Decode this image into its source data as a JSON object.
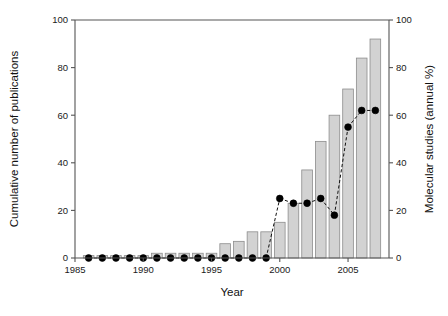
{
  "chart_data": {
    "type": "bar",
    "title": "",
    "subtitle": "",
    "xlabel": "Year",
    "ylabel": "Cumulative number of publications",
    "y2label": "Molecular studies (annual %)",
    "xlim": [
      1985,
      2008
    ],
    "ylim": [
      0,
      100
    ],
    "y2lim": [
      0,
      100
    ],
    "grid": false,
    "legend": "none",
    "x_ticks": [
      1985,
      1990,
      1995,
      2000,
      2005
    ],
    "x_tick_labels": [
      "1985",
      "1990",
      "1995",
      "2000",
      "2005"
    ],
    "y_ticks": [
      0,
      20,
      40,
      60,
      80,
      100
    ],
    "y_tick_labels": [
      "0",
      "20",
      "40",
      "60",
      "80",
      "100"
    ],
    "y2_ticks": [
      0,
      20,
      40,
      60,
      80,
      100
    ],
    "y2_tick_labels": [
      "0",
      "20",
      "40",
      "60",
      "80",
      "100"
    ],
    "categories": [
      1986,
      1987,
      1988,
      1989,
      1990,
      1991,
      1992,
      1993,
      1994,
      1995,
      1996,
      1997,
      1998,
      1999,
      2000,
      2001,
      2002,
      2003,
      2004,
      2005,
      2006,
      2007
    ],
    "series": [
      {
        "name": "Cumulative number of publications",
        "type": "bar",
        "axis": "left",
        "color": "#d2d2d2",
        "edge_color": "#8d8d8d",
        "values": [
          1,
          1,
          1,
          1,
          1,
          2,
          2,
          2,
          2,
          2,
          6,
          7,
          11,
          11,
          15,
          23,
          37,
          49,
          60,
          71,
          84,
          92
        ]
      },
      {
        "name": "Molecular studies (annual %)",
        "type": "line",
        "axis": "right",
        "color": "#000000",
        "marker": "filled-circle",
        "linestyle": "dashed",
        "values": [
          0,
          0,
          0,
          0,
          0,
          0,
          0,
          0,
          0,
          0,
          0,
          0,
          0,
          0,
          25,
          23,
          23,
          25,
          18,
          55,
          62,
          62
        ]
      }
    ]
  },
  "figure": {
    "background": "#ffffff",
    "axis_color": "#555555",
    "text_color": "#1a1a1a"
  }
}
